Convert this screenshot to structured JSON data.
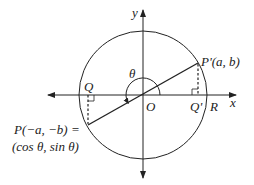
{
  "diagram": {
    "type": "unit-circle-reflection",
    "colors": {
      "stroke": "#222222",
      "background": "#ffffff"
    },
    "labels": {
      "y_axis": "y",
      "x_axis": "x",
      "origin": "O",
      "q": "Q",
      "q_prime": "Q'",
      "r": "R",
      "theta": "θ",
      "p_prime": "P'(a, b)",
      "p_line1": "P(−a, −b) =",
      "p_line2": "(cos θ, sin θ)"
    },
    "elements": [
      "unit circle centered at O",
      "x-axis with arrows both directions",
      "y-axis with arrows both directions",
      "segment from P to P' through O",
      "dashed perpendicular from P' to Q' on x-axis",
      "dashed perpendicular from P to Q on x-axis",
      "right-angle markers at Q and Q'",
      "angle arc θ from positive x-axis counterclockwise to OP"
    ]
  }
}
